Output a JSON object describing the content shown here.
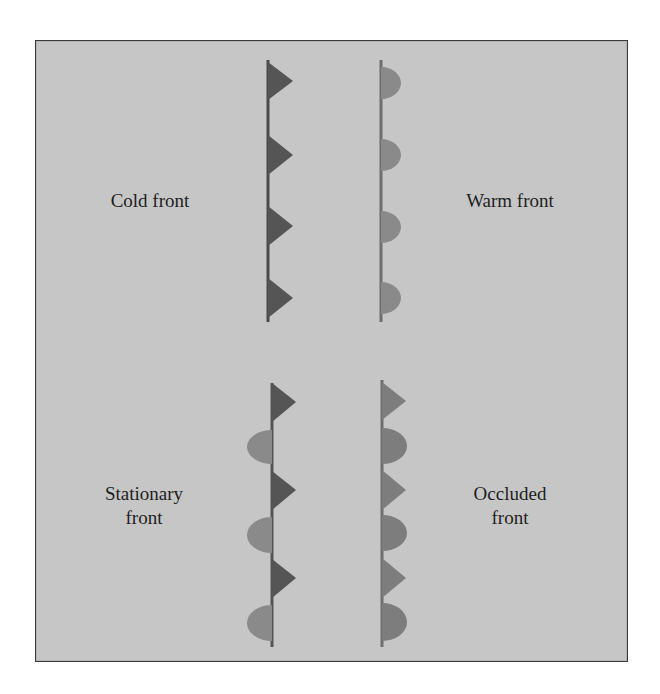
{
  "diagram": {
    "panels": [
      {
        "id": "cold",
        "label_lines": [
          "Cold front"
        ],
        "symbol": "triangle",
        "side": "right",
        "color": "#555555"
      },
      {
        "id": "warm",
        "label_lines": [
          "Warm front"
        ],
        "symbol": "semicircle",
        "side": "right",
        "color": "#8a8a8a"
      },
      {
        "id": "stationary",
        "label_lines": [
          "Stationary",
          "front"
        ],
        "symbols": [
          "triangle-right",
          "semicircle-left"
        ],
        "colors": {
          "triangle": "#555555",
          "semicircle": "#8a8a8a"
        }
      },
      {
        "id": "occluded",
        "label_lines": [
          "Occluded",
          "front"
        ],
        "symbols": [
          "triangle-right",
          "semicircle-right"
        ],
        "color": "#7d7d7d"
      }
    ],
    "colors": {
      "background": "#c6c6c6",
      "frame_border": "#3a3a3a",
      "cold": "#555555",
      "warm": "#8a8a8a",
      "occluded": "#7d7d7d",
      "text": "#1e1e1e"
    }
  },
  "labels": {
    "cold": "Cold front",
    "warm": "Warm front",
    "stationary_1": "Stationary",
    "stationary_2": "front",
    "occluded_1": "Occluded",
    "occluded_2": "front"
  }
}
